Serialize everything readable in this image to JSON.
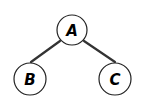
{
  "diagram": {
    "type": "tree",
    "nodes": [
      {
        "id": "A",
        "label": "A"
      },
      {
        "id": "B",
        "label": "B"
      },
      {
        "id": "C",
        "label": "C"
      }
    ],
    "edges": [
      {
        "from": "A",
        "to": "B"
      },
      {
        "from": "A",
        "to": "C"
      }
    ],
    "colors": {
      "edge": "#333333",
      "node_stroke": "#222222",
      "node_fill": "#ffffff",
      "label": "#000000"
    }
  }
}
